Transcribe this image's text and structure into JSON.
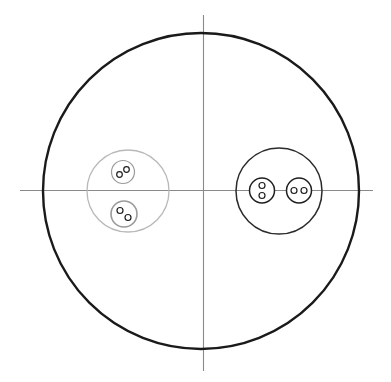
{
  "figure": {
    "canvas": {
      "width": 391,
      "height": 382,
      "background": "#ffffff"
    },
    "colors": {
      "outer_boundary": "#1a1a1a",
      "axis": "#8a8a8a",
      "left_cluster": "#b9b9b9",
      "left_inner": "#9a9a9a",
      "right_cluster": "#2b2b2b",
      "right_inner": "#1f1f1f",
      "dot_stroke": "#1f1f1f",
      "dot_fill": "#ffffff"
    }
  },
  "axes": {
    "horizontal": {
      "label": "horizontal-axis",
      "x1": 20,
      "y1": 190.5,
      "x2": 373,
      "y2": 190.5,
      "width": 1.1
    },
    "vertical": {
      "label": "vertical-axis",
      "x1": 203.5,
      "y1": 15,
      "x2": 203.5,
      "y2": 371,
      "width": 1.1
    },
    "origin": {
      "x": 203.5,
      "y": 190.5
    }
  },
  "outer_circle": {
    "label": "outer-boundary-circle",
    "cx": 201,
    "cy": 191,
    "r": 158,
    "stroke_width": 2.4
  },
  "clusters": [
    {
      "id": "left-cluster",
      "label": "left cluster",
      "tone": "light",
      "cx": 128,
      "cy": 191,
      "r": 41,
      "stroke_width": 1.3,
      "members": [
        {
          "id": "left-cluster-upper-circle",
          "label": "upper inner circle",
          "cx": 123,
          "cy": 172,
          "r": 11.5,
          "stroke_width": 1.2,
          "dots": [
            {
              "id": "dot-a",
              "cx": 119.5,
              "cy": 174.5,
              "r": 2.8
            },
            {
              "id": "dot-b",
              "cx": 126.5,
              "cy": 169.5,
              "r": 2.8
            }
          ]
        },
        {
          "id": "left-cluster-lower-circle",
          "label": "lower inner circle",
          "cx": 124,
          "cy": 214,
          "r": 13,
          "stroke_width": 1.6,
          "dots": [
            {
              "id": "dot-a",
              "cx": 120.0,
              "cy": 210.5,
              "r": 3.0
            },
            {
              "id": "dot-b",
              "cx": 128.0,
              "cy": 217.5,
              "r": 3.0
            }
          ]
        }
      ]
    },
    {
      "id": "right-cluster",
      "label": "right cluster",
      "tone": "dark",
      "cx": 279,
      "cy": 191,
      "r": 43,
      "stroke_width": 1.5,
      "members": [
        {
          "id": "right-cluster-left-circle",
          "label": "left inner circle",
          "cx": 262,
          "cy": 190.5,
          "r": 12.5,
          "stroke_width": 1.5,
          "dots": [
            {
              "id": "dot-a",
              "cx": 262.0,
              "cy": 185.5,
              "r": 3.0
            },
            {
              "id": "dot-b",
              "cx": 262.0,
              "cy": 195.5,
              "r": 3.0
            }
          ]
        },
        {
          "id": "right-cluster-right-circle",
          "label": "right inner circle",
          "cx": 299,
          "cy": 190.5,
          "r": 12.5,
          "stroke_width": 1.5,
          "dots": [
            {
              "id": "dot-a",
              "cx": 294.0,
              "cy": 190.5,
              "r": 3.0
            },
            {
              "id": "dot-b",
              "cx": 304.0,
              "cy": 190.5,
              "r": 3.0
            }
          ]
        }
      ]
    }
  ]
}
